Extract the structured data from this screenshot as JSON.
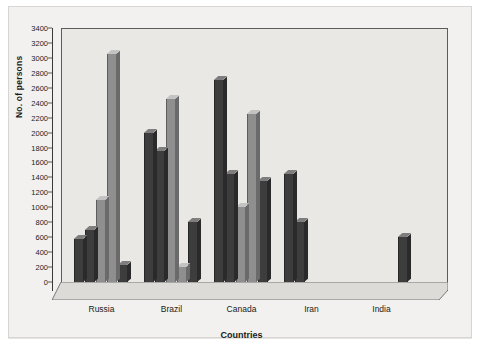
{
  "chart_data": {
    "type": "bar",
    "title": "",
    "xlabel": "Countries",
    "ylabel": "No. of persons",
    "ylim": [
      0,
      3400
    ],
    "ytick_step": 200,
    "yticks": [
      0,
      200,
      400,
      600,
      800,
      1000,
      1200,
      1400,
      1600,
      1800,
      2000,
      2200,
      2400,
      2600,
      2800,
      3000,
      3200,
      3400
    ],
    "grid": false,
    "legend": "none",
    "orientation": "vertical",
    "style": "3d-grouped-bars",
    "categories": [
      "Russia",
      "Brazil",
      "Canada",
      "Iran",
      "India"
    ],
    "series": [
      {
        "name": "Series 1",
        "values": [
          580,
          2000,
          2700,
          1450,
          0
        ]
      },
      {
        "name": "Series 2",
        "values": [
          700,
          1750,
          1450,
          800,
          0
        ]
      },
      {
        "name": "Series 3",
        "values": [
          1100,
          2450,
          1000,
          0,
          0
        ]
      },
      {
        "name": "Series 4",
        "values": [
          3050,
          200,
          2250,
          0,
          0
        ]
      },
      {
        "name": "Series 5",
        "values": [
          230,
          800,
          1350,
          0,
          600
        ]
      }
    ],
    "colors": {
      "bar_dark": "#3a3a3a",
      "bar_mid": "#6b6b6b",
      "bar_light": "#9a9a9a",
      "plot_background": "#e9e8e5",
      "page_background": "#f2f1ef",
      "axis": "#3b3a38",
      "text": "#1b1b1b"
    },
    "series_shades": [
      "dark",
      "dark",
      "light",
      "light",
      "dark"
    ]
  }
}
